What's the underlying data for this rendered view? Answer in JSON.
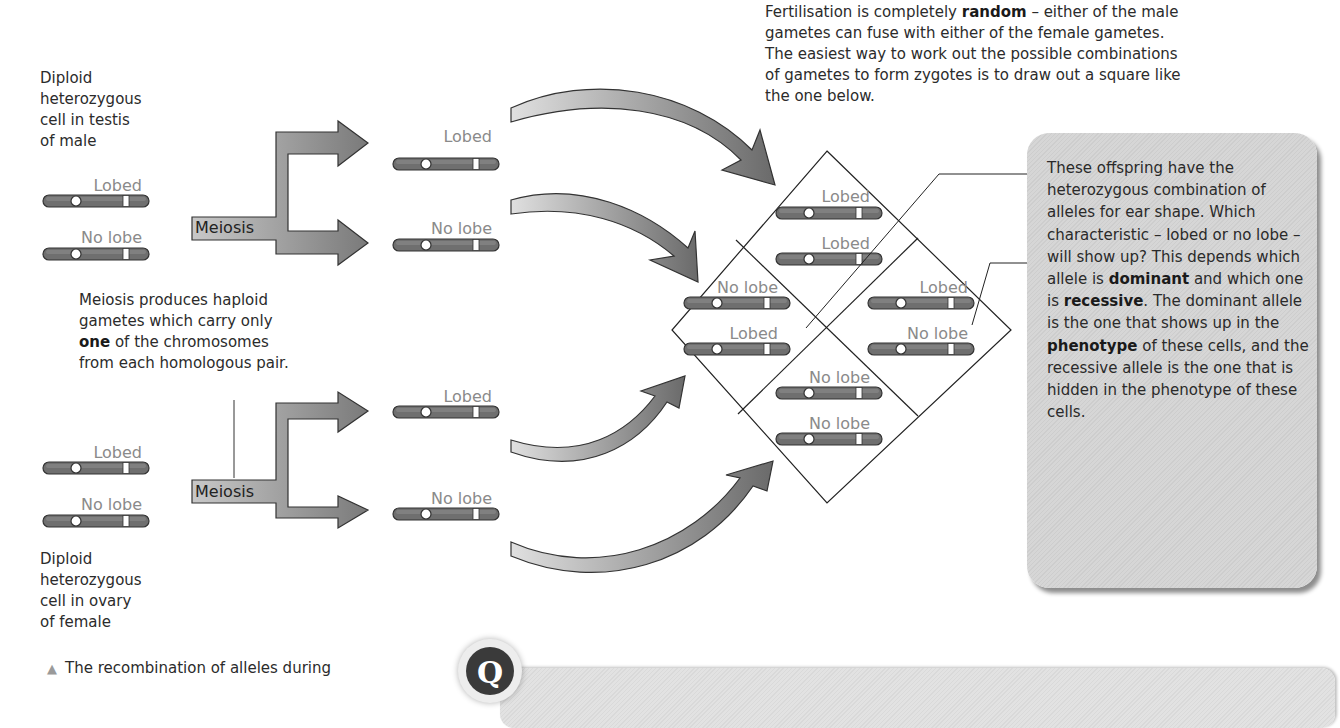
{
  "male": {
    "description_lines": [
      "Diploid",
      "heterozygous",
      "cell in testis",
      "of male"
    ],
    "chromosomes": [
      {
        "allele": "Lobed"
      },
      {
        "allele": "No lobe"
      }
    ],
    "process_label": "Meiosis",
    "gametes": [
      {
        "allele": "Lobed"
      },
      {
        "allele": "No lobe"
      }
    ]
  },
  "female": {
    "description_lines": [
      "Diploid",
      "heterozygous",
      "cell in ovary",
      "of female"
    ],
    "chromosomes": [
      {
        "allele": "Lobed"
      },
      {
        "allele": "No lobe"
      }
    ],
    "process_label": "Meiosis",
    "gametes": [
      {
        "allele": "Lobed"
      },
      {
        "allele": "No lobe"
      }
    ]
  },
  "meiosis_note": {
    "line1": "Meiosis produces haploid",
    "line2": "gametes which carry only",
    "line3_bold": "one",
    "line3_rest": " of the chromosomes",
    "line4": "from each homologous pair."
  },
  "fertilisation_note": {
    "part1": "Fertilisation is completely ",
    "bold": "random",
    "part2": " – either of the male",
    "line2": "gametes can fuse with either of the female gametes.",
    "line3": "The easiest way to work out the possible combinations",
    "line4": "of gametes to form zygotes is to draw out a square like",
    "line5": "the one below."
  },
  "punnett_square": {
    "cells": [
      {
        "position": "top",
        "alleles": [
          "Lobed",
          "Lobed"
        ]
      },
      {
        "position": "left",
        "alleles": [
          "No lobe",
          "Lobed"
        ]
      },
      {
        "position": "right",
        "alleles": [
          "Lobed",
          "No lobe"
        ]
      },
      {
        "position": "bottom",
        "alleles": [
          "No lobe",
          "No lobe"
        ]
      }
    ]
  },
  "callout": {
    "t1": "These offspring have the heterozygous combination of alleles for ear shape. Which characteristic – lobed or no lobe – will show up? This depends which allele is ",
    "b1": "dominant",
    "t2": " and which one is ",
    "b2": "recessive",
    "t3": ". The dominant allele is the one that shows up in the ",
    "b3": "phenotype",
    "t4": " of these cells, and the recessive allele is the one that is hidden in the phenotype of these cells."
  },
  "caption": {
    "marker": "▲",
    "text": "The recombination of alleles during"
  },
  "question_box": {
    "icon_letter": "Q"
  },
  "colors": {
    "chromosome_fill": "#6f6f6f",
    "allele_label": "#8a8a8a",
    "arrow_dark": "#6a6a6a",
    "arrow_light": "#dcdcdc",
    "callout_bg": "#d3d3d3"
  }
}
